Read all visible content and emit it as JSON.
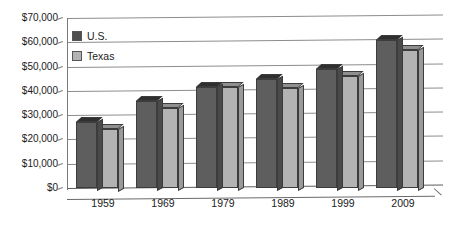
{
  "chart_data": {
    "type": "bar",
    "title": "",
    "xlabel": "",
    "ylabel": "",
    "categories": [
      "1959",
      "1969",
      "1979",
      "1989",
      "1999",
      "2009"
    ],
    "series": [
      {
        "name": "U.S.",
        "color": "#5e5e5e",
        "values": [
          27000,
          36000,
          41500,
          45000,
          49000,
          61000
        ]
      },
      {
        "name": "Texas",
        "color": "#b3b3b3",
        "values": [
          24500,
          33000,
          41500,
          41000,
          46000,
          57000
        ]
      }
    ],
    "ylim": [
      0,
      70000
    ],
    "ytick_values": [
      0,
      10000,
      20000,
      30000,
      40000,
      50000,
      60000,
      70000
    ],
    "ytick_labels": [
      "$0",
      "$10,000",
      "$20,000",
      "$30,000",
      "$40,000",
      "$50,000",
      "$60,000",
      "$70,000"
    ],
    "grid": true,
    "legend_position": "top-left",
    "style": "3d-column"
  },
  "legend": {
    "items": [
      {
        "label": "U.S."
      },
      {
        "label": "Texas"
      }
    ]
  }
}
